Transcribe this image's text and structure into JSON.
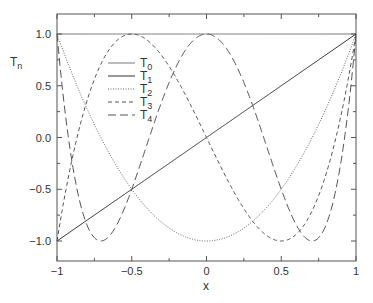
{
  "chart_data": {
    "type": "line",
    "title": "",
    "xlabel": "x",
    "ylabel": "T_n",
    "xlim": [
      -1,
      1
    ],
    "ylim": [
      -1.1,
      1.1
    ],
    "grid": false,
    "legend_position": "upper-left-inner",
    "x_ticks": [
      -1,
      -0.5,
      0,
      0.5,
      1
    ],
    "x_tick_labels": [
      "−1",
      "−0.5",
      "0",
      "0.5",
      "1"
    ],
    "y_ticks": [
      1.0,
      0.5,
      0.0,
      -0.5,
      -1.0
    ],
    "y_tick_labels": [
      "1.0",
      "0.5",
      "0.0",
      "−0.5",
      "−1.0"
    ],
    "series": [
      {
        "name": "T0",
        "formula": "1",
        "style": "solid",
        "color": "#555555"
      },
      {
        "name": "T1",
        "formula": "x",
        "style": "solid",
        "color": "#333333"
      },
      {
        "name": "T2",
        "formula": "2x^2-1",
        "style": "dotted",
        "color": "#555555"
      },
      {
        "name": "T3",
        "formula": "4x^3-3x",
        "style": "short-dash",
        "color": "#555555"
      },
      {
        "name": "T4",
        "formula": "8x^4-8x^2+1",
        "style": "long-dash",
        "color": "#555555"
      }
    ],
    "x": [
      -1,
      -0.75,
      -0.5,
      -0.25,
      0,
      0.25,
      0.5,
      0.75,
      1
    ],
    "values": {
      "T0": [
        1,
        1,
        1,
        1,
        1,
        1,
        1,
        1,
        1
      ],
      "T1": [
        -1,
        -0.75,
        -0.5,
        -0.25,
        0,
        0.25,
        0.5,
        0.75,
        1
      ],
      "T2": [
        1,
        0.125,
        -0.5,
        -0.875,
        -1,
        -0.875,
        -0.5,
        0.125,
        1
      ],
      "T3": [
        -1,
        0.5625,
        1,
        0.6875,
        0,
        -0.6875,
        -1,
        -0.5625,
        1
      ],
      "T4": [
        1,
        -0.97,
        -0.5,
        0.53,
        1,
        0.53,
        -0.5,
        -0.97,
        1
      ]
    }
  },
  "labels": {
    "ylabel_main": "T",
    "ylabel_sub": "n",
    "xlabel": "x"
  },
  "legend": [
    {
      "main": "T",
      "sub": "0"
    },
    {
      "main": "T",
      "sub": "1"
    },
    {
      "main": "T",
      "sub": "2"
    },
    {
      "main": "T",
      "sub": "3"
    },
    {
      "main": "T",
      "sub": "4"
    }
  ]
}
